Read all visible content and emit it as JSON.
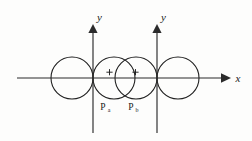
{
  "figure": {
    "title": "",
    "background_color": "#fdfdfc",
    "stroke_color": "#1f1f1f",
    "axes": [
      {
        "id": "x-axis",
        "label": "x",
        "orientation": "horizontal",
        "arrow": "right",
        "start_x": 17,
        "end_x": 227,
        "y": 78
      },
      {
        "id": "y-axis-left",
        "label": "y",
        "orientation": "vertical",
        "arrow": "up",
        "x": 93,
        "top_y": 27,
        "bottom_y": 133,
        "label_x": 97,
        "label_y": 21
      },
      {
        "id": "y-axis-right",
        "label": "y",
        "orientation": "vertical",
        "arrow": "up",
        "x": 157,
        "top_y": 27,
        "bottom_y": 133,
        "label_x": 161,
        "label_y": 21
      }
    ],
    "x_label_position": {
      "x": 238,
      "y": 82
    },
    "circles": [
      {
        "id": "circle-1",
        "cx": 72,
        "cy": 78,
        "r": 21
      },
      {
        "id": "circle-2",
        "cx": 114,
        "cy": 78,
        "r": 21
      },
      {
        "id": "circle-3",
        "cx": 136,
        "cy": 78,
        "r": 21
      },
      {
        "id": "circle-4",
        "cx": 178,
        "cy": 78,
        "r": 21
      }
    ],
    "charges": [
      {
        "id": "charge-a",
        "symbol": "+",
        "x": 110,
        "y": 74
      },
      {
        "id": "charge-b",
        "symbol": "+",
        "x": 136,
        "y": 74
      }
    ],
    "point_labels": [
      {
        "id": "label-pa",
        "base": "P",
        "sub": "a",
        "x": 103,
        "y": 110
      },
      {
        "id": "label-pb",
        "base": "P",
        "sub": "b",
        "x": 131,
        "y": 110
      }
    ]
  }
}
